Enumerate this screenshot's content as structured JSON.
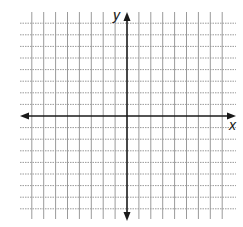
{
  "diagram": {
    "type": "coordinate-plane",
    "x_axis_label": "x",
    "y_axis_label": "y",
    "grid": {
      "lines_each_side_x": 8,
      "lines_each_side_y": 8,
      "style": "dotted",
      "color": "#9a9a9a"
    },
    "axes": {
      "color": "#1a1a1a",
      "arrows": [
        "left",
        "right",
        "up",
        "down"
      ]
    }
  }
}
